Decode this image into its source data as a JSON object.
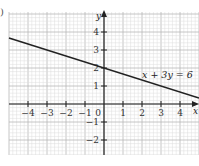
{
  "part_label": ")",
  "chart_data": {
    "type": "line",
    "title": "",
    "xlabel": "x",
    "ylabel": "y",
    "xlim": [
      -5,
      5
    ],
    "ylim": [
      -2.7,
      5
    ],
    "grid": true,
    "x_ticks": [
      -4,
      -3,
      -2,
      -1,
      0,
      1,
      2,
      3,
      4
    ],
    "x_tick_labels": [
      "−4",
      "−3",
      "−2",
      "−1",
      "0",
      "1",
      "2",
      "3",
      "4"
    ],
    "y_ticks": [
      -2,
      -1,
      1,
      2,
      3,
      4
    ],
    "y_tick_labels": [
      "−2",
      "−1",
      "1",
      "2",
      "3",
      "4"
    ],
    "series": [
      {
        "name": "x + 3y = 6",
        "x": [
          -5,
          5
        ],
        "y": [
          3.667,
          0.333
        ],
        "color": "#222222"
      }
    ],
    "annotations": [
      {
        "text": "x + 3y = 6",
        "x": 2.0,
        "y": 2.8
      }
    ]
  },
  "layout": {
    "origin_px": [
      104,
      104
    ],
    "unit_x_px": 19,
    "unit_y_px": 18,
    "grid_left": 9,
    "grid_right": 199,
    "grid_top": 12,
    "grid_bottom": 155
  }
}
